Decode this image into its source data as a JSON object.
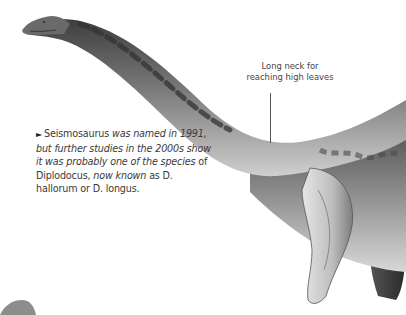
{
  "caption": {
    "arrow": "►",
    "segments": [
      {
        "text": "Seismosaurus ",
        "italic": false
      },
      {
        "text": "was named in 1991, but further studies in the 2000s show it was probably one of the species ",
        "italic": true
      },
      {
        "text": "of Diplodocus, ",
        "italic": false
      },
      {
        "text": "now known ",
        "italic": true
      },
      {
        "text": "as D. hallorum or D. longus.",
        "italic": false
      }
    ]
  },
  "callout": {
    "label": "Long neck for reaching high leaves"
  },
  "illustration": {
    "subject": "Seismosaurus (Diplodocus) neck and forelimbs",
    "colors": {
      "body_dark": "#4a4a4a",
      "body_mid": "#8a8a8a",
      "body_light": "#d4d4d4",
      "background": "#ffffff"
    }
  }
}
